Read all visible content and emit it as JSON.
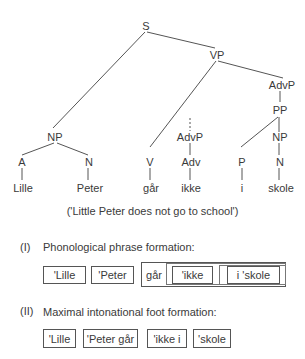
{
  "tree": {
    "nodes": {
      "S": "S",
      "VP": "VP",
      "AdvP_top": "AdvP",
      "PP": "PP",
      "NP_subj": "NP",
      "AdvP_mid": "AdvP",
      "NP_obj": "NP",
      "A": "A",
      "N_subj": "N",
      "V": "V",
      "Adv": "Adv",
      "P": "P",
      "N_obj": "N"
    },
    "words": {
      "w1": "Lille",
      "w2": "Peter",
      "w3": "går",
      "w4": "ikke",
      "w5": "i",
      "w6": "skole"
    }
  },
  "gloss": "('Little Peter does not go to school')",
  "section_1": {
    "number": "(I)",
    "title": "Phonological phrase formation:",
    "boxes": [
      "'Lille",
      "'Peter",
      "går",
      "'ikke",
      "i 'skole"
    ]
  },
  "section_2": {
    "number": "(II)",
    "title": "Maximal intonational foot formation:",
    "boxes": [
      "'Lille",
      "'Peter går",
      "'ikke i",
      "'skole"
    ]
  }
}
